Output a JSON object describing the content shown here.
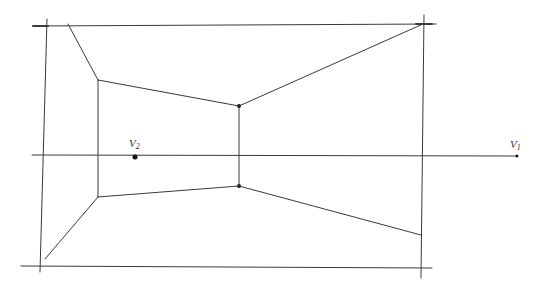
{
  "diagram": {
    "stroke_color": "#3a3a3a",
    "labels": {
      "v1": "V",
      "v1_sub": "1",
      "v2": "V",
      "v2_sub": "2"
    },
    "points": {
      "v1": [
        517,
        156
      ],
      "v2": [
        135,
        157
      ]
    },
    "frame": {
      "top_line": [
        [
          33,
          26
        ],
        [
          436,
          24
        ]
      ],
      "bottom_line": [
        [
          21,
          266
        ],
        [
          432,
          268
        ]
      ],
      "left_line": [
        [
          47,
          19
        ],
        [
          40,
          272
        ]
      ],
      "right_line": [
        [
          424,
          15
        ],
        [
          421,
          278
        ]
      ],
      "horizon": [
        [
          32,
          155
        ],
        [
          517,
          156
        ]
      ]
    },
    "room": {
      "back_wall_left": [
        [
          98,
          80
        ],
        [
          98,
          197
        ]
      ],
      "back_wall_right": [
        [
          239,
          106
        ],
        [
          239,
          186
        ]
      ],
      "edges": [
        [
          [
            68,
            24
          ],
          [
            98,
            80
          ]
        ],
        [
          [
            98,
            80
          ],
          [
            239,
            106
          ]
        ],
        [
          [
            239,
            106
          ],
          [
            423,
            24
          ]
        ],
        [
          [
            98,
            197
          ],
          [
            239,
            186
          ]
        ],
        [
          [
            239,
            186
          ],
          [
            421,
            235
          ]
        ],
        [
          [
            98,
            197
          ],
          [
            45,
            259
          ]
        ]
      ]
    }
  }
}
